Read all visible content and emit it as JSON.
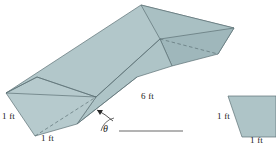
{
  "figure": {
    "background_color": "#ffffff",
    "fill_color": "#aec4c7",
    "fill_color_light": "#b9ccce",
    "fill_color_dark": "#a3babd",
    "stroke_color": "#5d7175",
    "label_color": "#1a1a1a",
    "labels": {
      "left_height": "1 ft",
      "bottom_width": "1 ft",
      "length": "6 ft",
      "angle": "θ",
      "cross_section_left": "1 ft",
      "cross_section_bottom": "1 ft"
    },
    "geometry": {
      "prism": {
        "near_face_points": "6,93 37,77 96,97 77,124 35,136",
        "top_face_points": "6,93 141,5 234,28 96,97",
        "right_upper_face_points": "141,5 234,28 218,54 160,39",
        "far_face_points": "234,28 218,54 172,66 160,39",
        "lower_long_face_points": "96,97 160,39 172,66 137,77 77,124",
        "hidden_edge_1": "35,136 96,97",
        "hidden_edge_2": "160,39 218,54",
        "solid_edge_fold": "6,93 96,97",
        "solid_edge_lower": "96,97 160,39"
      },
      "ground_line": "119,131 183,131",
      "angle_arc": "arc at vertex 119,131 radius 18",
      "arrow": "from 113,121 to 95,110",
      "cross_section_points": "228,96 275,96 275,137 242,137"
    }
  }
}
